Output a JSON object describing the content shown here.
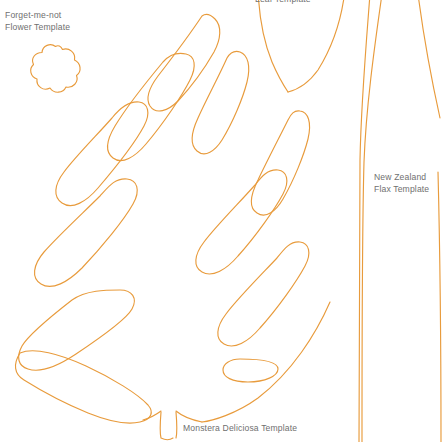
{
  "page": {
    "background_color": "#ffffff",
    "stroke_color": "#e89b3c",
    "text_color": "#6f6f6f",
    "width": 442,
    "height": 442
  },
  "labels": {
    "forget_me_not": "Forget-me-not\nFlower Template",
    "new_zealand_flax": "New Zealand\nFlax Template",
    "monstera": "Monstera Deliciosa Template",
    "top_cut_off": "Leaf Template"
  },
  "templates": [
    {
      "name": "forget-me-not-flower",
      "label": "Forget-me-not\nFlower Template",
      "shape": "five-petal-flower-outline",
      "position": "top-left"
    },
    {
      "name": "monstera-deliciosa-leaf",
      "label": "Monstera Deliciosa Template",
      "shape": "split-lobed-leaf-outline-with-stem-and-oval-hole",
      "position": "center-left"
    },
    {
      "name": "new-zealand-flax",
      "label": "New Zealand\nFlax Template",
      "shape": "long-tapering-blade-outlines",
      "position": "right"
    },
    {
      "name": "top-cut-off-leaf",
      "label": "Leaf Template",
      "shape": "v-shaped-leaf-tip-outline",
      "position": "top-center"
    }
  ]
}
